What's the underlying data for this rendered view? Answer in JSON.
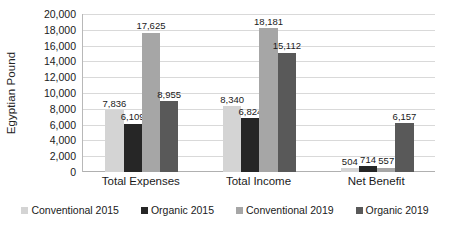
{
  "chart_data": {
    "type": "bar",
    "title": "",
    "xlabel": "",
    "ylabel": "Egyptian Pound",
    "ylim": [
      0,
      20000
    ],
    "ytick_step": 2000,
    "ytick_labels": [
      "20,000",
      "18,000",
      "16,000",
      "14,000",
      "12,000",
      "10,000",
      "8,000",
      "6,000",
      "4,000",
      "2,000",
      "0"
    ],
    "ytick_values": [
      20000,
      18000,
      16000,
      14000,
      12000,
      10000,
      8000,
      6000,
      4000,
      2000,
      0
    ],
    "grid": true,
    "grid_axis": "y",
    "legend_position": "bottom",
    "categories": [
      "Total Expenses",
      "Total Income",
      "Net Benefit"
    ],
    "series": [
      {
        "name": "Conventional 2015",
        "color": "#d4d4d4",
        "values": [
          7836,
          8340,
          504
        ],
        "labels": [
          "7,836",
          "8,340",
          "504"
        ]
      },
      {
        "name": "Organic 2015",
        "color": "#262626",
        "values": [
          6109,
          6824,
          714
        ],
        "labels": [
          "6,109",
          "6,824",
          "714"
        ]
      },
      {
        "name": "Conventional 2019",
        "color": "#a6a6a6",
        "values": [
          17625,
          18181,
          557
        ],
        "labels": [
          "17,625",
          "18,181",
          "557"
        ]
      },
      {
        "name": "Organic 2019",
        "color": "#595959",
        "values": [
          8955,
          15112,
          6157
        ],
        "labels": [
          "8,955",
          "15,112",
          "6,157"
        ]
      }
    ]
  }
}
